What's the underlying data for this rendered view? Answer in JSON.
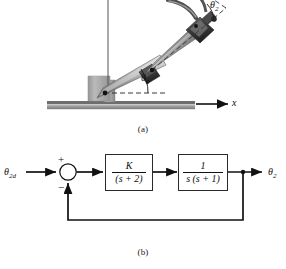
{
  "figure": {
    "panel_a": {
      "caption": "(a)",
      "title": "robot arm schematic",
      "labels": {
        "theta1": "θ",
        "theta1_sub": "1",
        "theta2": "θ",
        "theta2_sub": "2",
        "x_axis": "x"
      },
      "colors": {
        "ground": "#8f8f8f",
        "ground_top": "#b9b9b9",
        "column": "#a8a8a8",
        "link_light": "#d2d2d2",
        "link_mid": "#9a9a9a",
        "link_dark": "#6e6e6e",
        "joint": "#1b1b1b",
        "guide": "#3a3a3a"
      }
    },
    "panel_b": {
      "caption": "(b)",
      "title": "closed-loop block diagram",
      "input_label": "θ",
      "input_sub": "2d",
      "output_label": "θ",
      "output_sub": "2",
      "summing_junction": {
        "name": "summing-junction",
        "plus_sign": "+",
        "minus_sign": "−"
      },
      "blocks": [
        {
          "name": "controller-block",
          "numerator": "K",
          "denominator": "(s + 2)"
        },
        {
          "name": "plant-block",
          "numerator": "1",
          "denominator": "s (s + 1)"
        }
      ],
      "feedback": "unity negative feedback",
      "colors": {
        "line": "#111111",
        "box_border": "#2a2a2a",
        "box_fill": "#ffffff"
      }
    }
  }
}
